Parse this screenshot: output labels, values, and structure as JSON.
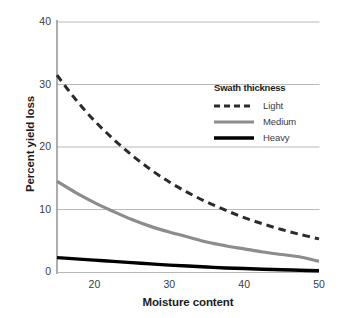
{
  "chart_data": {
    "type": "line",
    "title": "",
    "xlabel": "Moisture content",
    "ylabel": "Percent yield loss",
    "xlim": [
      15,
      50
    ],
    "ylim": [
      0,
      40
    ],
    "xticks": [
      20,
      30,
      40,
      50
    ],
    "yticks": [
      0,
      10,
      20,
      30,
      40
    ],
    "grid": "horizontal",
    "legend_position": "top-right-inside",
    "legend_title": "Swath thickness",
    "x": [
      15,
      17.5,
      20,
      22.5,
      25,
      27.5,
      30,
      32.5,
      35,
      37.5,
      40,
      42.5,
      45,
      47.5,
      50
    ],
    "series": [
      {
        "name": "Light",
        "style": "dashed",
        "color": "#2b2b2b",
        "values": [
          31.5,
          27.6,
          24.2,
          21.3,
          18.7,
          16.4,
          14.4,
          12.7,
          11.2,
          9.9,
          8.7,
          7.7,
          6.8,
          6.0,
          5.3
        ]
      },
      {
        "name": "Medium",
        "style": "solid",
        "color": "#8c8c8c",
        "values": [
          14.5,
          12.7,
          11.1,
          9.7,
          8.4,
          7.3,
          6.4,
          5.6,
          4.8,
          4.2,
          3.7,
          3.2,
          2.8,
          2.4,
          1.7
        ]
      },
      {
        "name": "Heavy",
        "style": "solid",
        "color": "#000000",
        "values": [
          2.3,
          2.1,
          1.9,
          1.7,
          1.5,
          1.3,
          1.1,
          0.95,
          0.8,
          0.65,
          0.55,
          0.45,
          0.35,
          0.28,
          0.2
        ]
      }
    ]
  },
  "axis": {
    "ytick_labels": [
      "0",
      "10",
      "20",
      "30",
      "40"
    ],
    "xtick_labels": [
      "20",
      "30",
      "40",
      "50"
    ]
  },
  "legend": {
    "title": "Swath thickness",
    "items": [
      {
        "label": "Light"
      },
      {
        "label": "Medium"
      },
      {
        "label": "Heavy"
      }
    ]
  },
  "colors": {
    "light_series": "#2b2b2b",
    "medium_series": "#8c8c8c",
    "heavy_series": "#000000",
    "grid": "#b9b9b9",
    "axis": "#8a8a8a",
    "text": "#231f20",
    "background": "#ffffff"
  }
}
